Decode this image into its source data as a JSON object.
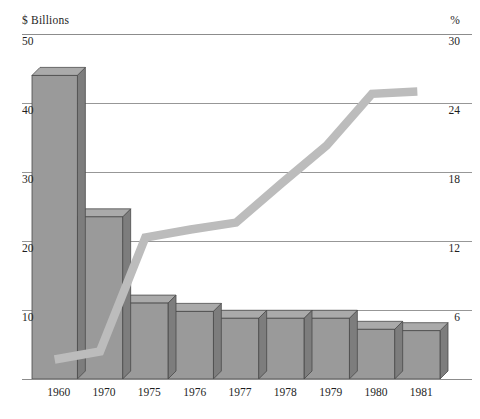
{
  "chart_data": {
    "type": "bar",
    "title": "",
    "subtitle": "",
    "xlabel": "",
    "ylabel": "$ Billions",
    "y2label": "%",
    "grid": true,
    "legend_position": "none",
    "categories": [
      "1960",
      "1970",
      "1975",
      "1976",
      "1977",
      "1978",
      "1979",
      "1980",
      "1981"
    ],
    "ylim": [
      0,
      50
    ],
    "yticks": [
      10,
      20,
      30,
      40,
      50
    ],
    "y2lim": [
      0,
      30
    ],
    "y2ticks": [
      6,
      12,
      18,
      24,
      30
    ],
    "series": [
      {
        "name": "Dollars",
        "type": "bar",
        "axis": "left",
        "unit": "$ Billions",
        "values": [
          44.0,
          23.5,
          11.0,
          9.8,
          8.8,
          8.8,
          8.8,
          7.2,
          7.0
        ]
      },
      {
        "name": "Percent",
        "type": "line",
        "axis": "right",
        "unit": "%",
        "values": [
          1.7,
          2.4,
          12.3,
          13.0,
          13.6,
          17.0,
          20.3,
          24.8,
          25.0
        ]
      }
    ],
    "colors": {
      "bar_face": "#9a9a9a",
      "bar_top": "#aaaaaa",
      "bar_side": "#7d7d7d",
      "bar_edge": "#4a4a4a",
      "line": "#bcbcbc",
      "grid": "#8c8c8c",
      "axis_text": "#1e1e1e",
      "background": "#ffffff"
    }
  },
  "labels": {
    "unit_left": "$ Billions",
    "unit_right": "%",
    "left_ticks": [
      "50",
      "40",
      "30",
      "20",
      "10"
    ],
    "right_ticks": [
      "30",
      "24",
      "18",
      "12",
      "6"
    ],
    "x_ticks": [
      "1960",
      "1970",
      "1975",
      "1976",
      "1977",
      "1978",
      "1979",
      "1980",
      "1981"
    ],
    "caption": ""
  }
}
